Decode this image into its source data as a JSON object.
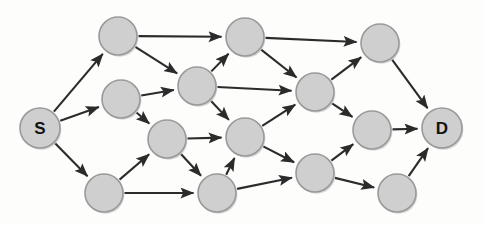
{
  "diagram": {
    "type": "directed-graph",
    "width": 484,
    "height": 225,
    "background_color": "#fdfdfc",
    "node_fill_color": "#cfcfcf",
    "node_stroke_color": "#9a9a9a",
    "edge_color": "#2b2b2b",
    "label_color": "#111111",
    "node_radius": 19,
    "source_label": "S",
    "destination_label": "D"
  },
  "nodes": [
    {
      "id": "S",
      "label": "S",
      "x": 40,
      "y": 128,
      "r": 20,
      "labeled": true
    },
    {
      "id": "A",
      "label": "",
      "x": 118,
      "y": 36,
      "r": 19,
      "labeled": false
    },
    {
      "id": "B",
      "label": "",
      "x": 121,
      "y": 99,
      "r": 19,
      "labeled": false
    },
    {
      "id": "C",
      "label": "",
      "x": 104,
      "y": 193,
      "r": 19,
      "labeled": false
    },
    {
      "id": "E",
      "label": "",
      "x": 197,
      "y": 86,
      "r": 19,
      "labeled": false
    },
    {
      "id": "F",
      "label": "",
      "x": 167,
      "y": 139,
      "r": 19,
      "labeled": false
    },
    {
      "id": "G",
      "label": "",
      "x": 245,
      "y": 37,
      "r": 19,
      "labeled": false
    },
    {
      "id": "H",
      "label": "",
      "x": 245,
      "y": 137,
      "r": 19,
      "labeled": false
    },
    {
      "id": "I",
      "label": "",
      "x": 217,
      "y": 193,
      "r": 19,
      "labeled": false
    },
    {
      "id": "J",
      "label": "",
      "x": 315,
      "y": 92,
      "r": 19,
      "labeled": false
    },
    {
      "id": "K",
      "label": "",
      "x": 315,
      "y": 173,
      "r": 19,
      "labeled": false
    },
    {
      "id": "L",
      "label": "",
      "x": 380,
      "y": 43,
      "r": 19,
      "labeled": false
    },
    {
      "id": "M",
      "label": "",
      "x": 372,
      "y": 130,
      "r": 19,
      "labeled": false
    },
    {
      "id": "N",
      "label": "",
      "x": 397,
      "y": 193,
      "r": 19,
      "labeled": false
    },
    {
      "id": "D",
      "label": "D",
      "x": 442,
      "y": 128,
      "r": 20,
      "labeled": true
    }
  ],
  "edges": [
    {
      "from": "S",
      "to": "A"
    },
    {
      "from": "S",
      "to": "B"
    },
    {
      "from": "S",
      "to": "C"
    },
    {
      "from": "A",
      "to": "G"
    },
    {
      "from": "A",
      "to": "E"
    },
    {
      "from": "B",
      "to": "E"
    },
    {
      "from": "B",
      "to": "F"
    },
    {
      "from": "C",
      "to": "F"
    },
    {
      "from": "C",
      "to": "I"
    },
    {
      "from": "E",
      "to": "G"
    },
    {
      "from": "E",
      "to": "J"
    },
    {
      "from": "E",
      "to": "H"
    },
    {
      "from": "F",
      "to": "H"
    },
    {
      "from": "F",
      "to": "I"
    },
    {
      "from": "G",
      "to": "L"
    },
    {
      "from": "G",
      "to": "J"
    },
    {
      "from": "H",
      "to": "J"
    },
    {
      "from": "H",
      "to": "K"
    },
    {
      "from": "I",
      "to": "H"
    },
    {
      "from": "I",
      "to": "K"
    },
    {
      "from": "J",
      "to": "L"
    },
    {
      "from": "J",
      "to": "M"
    },
    {
      "from": "K",
      "to": "M"
    },
    {
      "from": "K",
      "to": "N"
    },
    {
      "from": "L",
      "to": "D"
    },
    {
      "from": "M",
      "to": "D"
    },
    {
      "from": "N",
      "to": "D"
    }
  ]
}
